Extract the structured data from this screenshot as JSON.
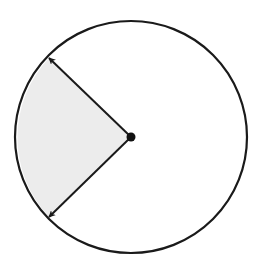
{
  "diagram": {
    "type": "circle-sector",
    "circle": {
      "cx": 131,
      "cy": 137,
      "r": 116,
      "stroke": "#1a1a1a",
      "stroke_width": 2.2
    },
    "center_point": {
      "cx": 131,
      "cy": 137,
      "r": 4.5,
      "fill": "#111111"
    },
    "sector": {
      "fill": "#ececec",
      "start_point": [
        49,
        58
      ],
      "end_point": [
        49,
        217
      ]
    },
    "radii": [
      {
        "name": "radius-upper-left",
        "from": [
          131,
          137
        ],
        "to": [
          49,
          58
        ]
      },
      {
        "name": "radius-lower-left",
        "from": [
          131,
          137
        ],
        "to": [
          49,
          217
        ]
      }
    ],
    "colors": {
      "background": "#ffffff",
      "line": "#1a1a1a",
      "shade": "#ececec"
    }
  }
}
